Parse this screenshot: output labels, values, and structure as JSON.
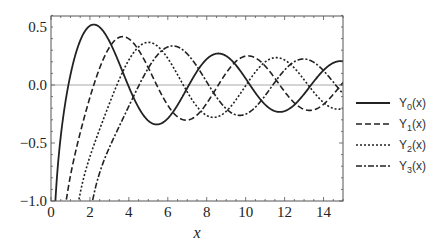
{
  "chart_data": {
    "type": "line",
    "title": "",
    "xlabel": "x",
    "ylabel": "",
    "xlim": [
      0,
      15
    ],
    "ylim": [
      -1.0,
      0.6
    ],
    "grid": false,
    "zero_line": true,
    "legend_position": "right",
    "x_ticks": [
      "0",
      "2",
      "4",
      "6",
      "8",
      "10",
      "12",
      "14"
    ],
    "y_ticks": [
      "-1.0",
      "-0.5",
      "0.0",
      "0.5"
    ],
    "series": [
      {
        "name": "Y0(x)",
        "base": "Y",
        "sub": "0",
        "arg": "(x)",
        "order": 0,
        "style": "solid"
      },
      {
        "name": "Y1(x)",
        "base": "Y",
        "sub": "1",
        "arg": "(x)",
        "order": 1,
        "style": "dashed"
      },
      {
        "name": "Y2(x)",
        "base": "Y",
        "sub": "2",
        "arg": "(x)",
        "order": 2,
        "style": "dotted"
      },
      {
        "name": "Y3(x)",
        "base": "Y",
        "sub": "3",
        "arg": "(x)",
        "order": 3,
        "style": "dashdot"
      }
    ],
    "sample_points": {
      "x": [
        1,
        2,
        3,
        4,
        5,
        6,
        7,
        8,
        9,
        10,
        11,
        12,
        13,
        14,
        15
      ],
      "Y0": [
        0.088,
        0.51,
        0.377,
        -0.017,
        -0.309,
        -0.288,
        -0.026,
        0.223,
        0.25,
        0.056,
        -0.169,
        -0.225,
        -0.078,
        0.127,
        0.205
      ],
      "Y1": [
        -0.781,
        -0.107,
        0.325,
        0.398,
        0.148,
        -0.175,
        -0.303,
        -0.158,
        0.104,
        0.249,
        0.164,
        -0.057,
        -0.21,
        -0.167,
        0.021
      ],
      "Y2": [
        -1.651,
        -0.617,
        -0.16,
        0.216,
        0.368,
        0.23,
        -0.06,
        -0.263,
        -0.227,
        -0.006,
        0.199,
        0.215,
        0.043,
        -0.152,
        -0.208
      ],
      "Y3": [
        -5.822,
        -1.128,
        -0.538,
        -0.182,
        0.146,
        0.328,
        0.27,
        0.026,
        -0.2,
        -0.252,
        -0.072,
        0.136,
        0.217,
        0.116,
        -0.058
      ]
    }
  },
  "legend": {
    "items": [
      {
        "base": "Y",
        "sub": "0",
        "arg": "(x)"
      },
      {
        "base": "Y",
        "sub": "1",
        "arg": "(x)"
      },
      {
        "base": "Y",
        "sub": "2",
        "arg": "(x)"
      },
      {
        "base": "Y",
        "sub": "3",
        "arg": "(x)"
      }
    ]
  },
  "axes": {
    "xlabel": "x",
    "x_ticks": [
      "0",
      "2",
      "4",
      "6",
      "8",
      "10",
      "12",
      "14"
    ],
    "y_ticks": [
      "−1.0",
      "−0.5",
      "0.0",
      "0.5"
    ]
  },
  "colors": {
    "line": "#222222",
    "frame": "#555555",
    "zero_line": "#aaaaaa"
  }
}
